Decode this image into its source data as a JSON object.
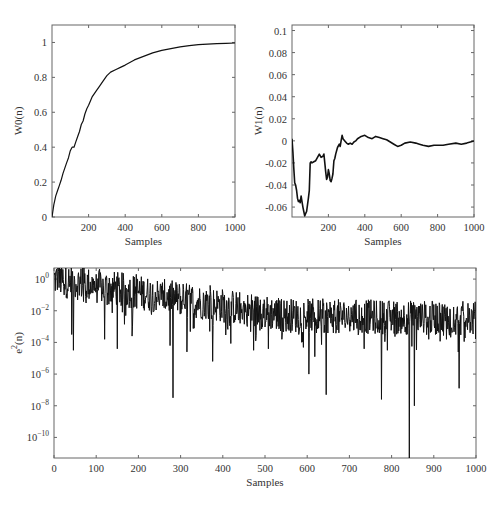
{
  "chart_data": [
    {
      "id": "w0",
      "type": "line",
      "title": "",
      "xlabel": "Samples",
      "ylabel": "W0(n)",
      "xlim": [
        0,
        1000
      ],
      "ylim": [
        0,
        1.1
      ],
      "grid": false,
      "box": {
        "left": 52,
        "top": 25,
        "right": 235,
        "bottom": 217
      },
      "xticks": [
        200,
        400,
        600,
        800,
        1000
      ],
      "xtick_labels": [
        "200",
        "400",
        "600",
        "800",
        "1000"
      ],
      "yticks": [
        0,
        0.2,
        0.4,
        0.6,
        0.8,
        1
      ],
      "ytick_labels": [
        "0",
        "0.2",
        "0.4",
        "0.6",
        "0.8",
        "1"
      ],
      "line_width": 1.2,
      "x": [
        0,
        10,
        20,
        30,
        40,
        50,
        60,
        70,
        80,
        90,
        100,
        110,
        120,
        130,
        140,
        150,
        160,
        170,
        180,
        190,
        200,
        220,
        240,
        260,
        280,
        300,
        320,
        350,
        380,
        400,
        450,
        500,
        550,
        600,
        650,
        700,
        750,
        800,
        850,
        900,
        950,
        1000
      ],
      "y": [
        0,
        0.07,
        0.12,
        0.15,
        0.18,
        0.21,
        0.25,
        0.28,
        0.31,
        0.34,
        0.38,
        0.4,
        0.4,
        0.43,
        0.46,
        0.49,
        0.53,
        0.55,
        0.59,
        0.62,
        0.64,
        0.69,
        0.72,
        0.75,
        0.78,
        0.81,
        0.83,
        0.845,
        0.86,
        0.87,
        0.9,
        0.92,
        0.94,
        0.955,
        0.965,
        0.975,
        0.982,
        0.987,
        0.99,
        0.993,
        0.995,
        0.997
      ]
    },
    {
      "id": "w1",
      "type": "line",
      "title": "",
      "xlabel": "Samples",
      "ylabel": "W1(n)",
      "xlim": [
        0,
        1000
      ],
      "ylim": [
        -0.069,
        0.105
      ],
      "grid": false,
      "box": {
        "left": 292,
        "top": 25,
        "right": 474,
        "bottom": 217
      },
      "xticks": [
        200,
        400,
        600,
        800,
        1000
      ],
      "xtick_labels": [
        "200",
        "400",
        "600",
        "800",
        "1000"
      ],
      "yticks": [
        -0.06,
        -0.04,
        -0.02,
        0,
        0.02,
        0.04,
        0.06,
        0.08,
        0.1
      ],
      "ytick_labels": [
        "-0.06",
        "-0.04",
        "-0.02",
        "0",
        "0.02",
        "0.04",
        "0.06",
        "0.08",
        "0.1"
      ],
      "line_width": 1.6,
      "x": [
        0,
        5,
        10,
        15,
        20,
        25,
        30,
        35,
        40,
        45,
        50,
        55,
        60,
        65,
        70,
        75,
        80,
        85,
        90,
        95,
        100,
        105,
        110,
        120,
        130,
        140,
        150,
        160,
        170,
        175,
        180,
        185,
        190,
        195,
        200,
        205,
        210,
        215,
        220,
        225,
        230,
        235,
        240,
        250,
        260,
        265,
        270,
        275,
        280,
        290,
        300,
        310,
        320,
        330,
        340,
        350,
        360,
        380,
        400,
        420,
        440,
        460,
        480,
        500,
        520,
        540,
        560,
        580,
        600,
        620,
        650,
        680,
        700,
        720,
        750,
        780,
        800,
        830,
        860,
        900,
        930,
        960,
        1000
      ],
      "y": [
        0.002,
        -0.01,
        -0.025,
        -0.038,
        -0.04,
        -0.045,
        -0.052,
        -0.055,
        -0.054,
        -0.056,
        -0.05,
        -0.055,
        -0.06,
        -0.064,
        -0.068,
        -0.066,
        -0.064,
        -0.058,
        -0.052,
        -0.045,
        -0.02,
        -0.019,
        -0.02,
        -0.019,
        -0.018,
        -0.015,
        -0.012,
        -0.015,
        -0.014,
        -0.012,
        -0.02,
        -0.028,
        -0.035,
        -0.033,
        -0.026,
        -0.03,
        -0.036,
        -0.037,
        -0.034,
        -0.03,
        -0.018,
        -0.016,
        -0.012,
        -0.006,
        -0.003,
        -0.005,
        0.0,
        0.005,
        0.002,
        0.0,
        -0.002,
        -0.003,
        -0.002,
        -0.003,
        -0.001,
        0.0,
        0.002,
        0.004,
        0.005,
        0.003,
        0.002,
        0.004,
        0.003,
        0.002,
        0.001,
        -0.001,
        -0.003,
        -0.005,
        -0.004,
        -0.002,
        -0.001,
        -0.002,
        -0.003,
        -0.004,
        -0.005,
        -0.004,
        -0.004,
        -0.004,
        -0.003,
        -0.002,
        -0.003,
        -0.002,
        0.0
      ]
    },
    {
      "id": "e2",
      "type": "line",
      "title": "",
      "xlabel": "Samples",
      "ylabel": "e²(n)",
      "yscale": "log",
      "xlim": [
        0,
        1000
      ],
      "ylim_log10": [
        -11.3,
        0.7
      ],
      "grid": false,
      "box": {
        "left": 54,
        "top": 268,
        "right": 476,
        "bottom": 458
      },
      "xticks": [
        0,
        100,
        200,
        300,
        400,
        500,
        600,
        700,
        800,
        900,
        1000
      ],
      "xtick_labels": [
        "0",
        "100",
        "200",
        "300",
        "400",
        "500",
        "600",
        "700",
        "800",
        "900",
        "1000"
      ],
      "yticks_log10": [
        0,
        -2,
        -4,
        -6,
        -8,
        -10
      ],
      "ytick_labels": [
        "10",
        "10",
        "10",
        "10",
        "10",
        "10"
      ],
      "ytick_exponents": [
        "0",
        "−2",
        "−4",
        "−6",
        "−8",
        "−10"
      ],
      "line_width": 1.0,
      "trend_log10": {
        "start": 0.0,
        "end": -2.3,
        "spread": 1.1
      },
      "notable_dips": [
        {
          "x": 42,
          "log10": -3.5
        },
        {
          "x": 46,
          "log10": -4.5
        },
        {
          "x": 120,
          "log10": -3.8
        },
        {
          "x": 150,
          "log10": -4.4
        },
        {
          "x": 185,
          "log10": -3.6
        },
        {
          "x": 275,
          "log10": -4.2
        },
        {
          "x": 282,
          "log10": -7.5
        },
        {
          "x": 315,
          "log10": -4.6
        },
        {
          "x": 376,
          "log10": -5.2
        },
        {
          "x": 400,
          "log10": -5.2
        },
        {
          "x": 473,
          "log10": -4.5
        },
        {
          "x": 508,
          "log10": -4.4
        },
        {
          "x": 540,
          "log10": -3.8
        },
        {
          "x": 580,
          "log10": -3.5
        },
        {
          "x": 604,
          "log10": -6.0
        },
        {
          "x": 618,
          "log10": -4.9
        },
        {
          "x": 645,
          "log10": -7.3
        },
        {
          "x": 735,
          "log10": -4.4
        },
        {
          "x": 776,
          "log10": -7.6
        },
        {
          "x": 790,
          "log10": -4.5
        },
        {
          "x": 842,
          "log10": -11.3
        },
        {
          "x": 854,
          "log10": -8.0
        },
        {
          "x": 888,
          "log10": -3.8
        },
        {
          "x": 930,
          "log10": -3.8
        },
        {
          "x": 960,
          "log10": -6.9
        }
      ],
      "notable_peaks": [
        {
          "x": 10,
          "log10": 0.7
        },
        {
          "x": 68,
          "log10": 0.7
        },
        {
          "x": 100,
          "log10": 0.3
        },
        {
          "x": 195,
          "log10": 0.3
        },
        {
          "x": 370,
          "log10": -0.4
        },
        {
          "x": 400,
          "log10": -0.9
        }
      ]
    }
  ]
}
